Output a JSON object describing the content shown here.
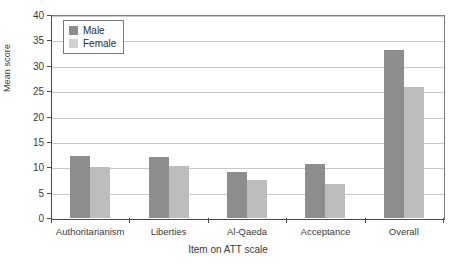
{
  "chart_data": {
    "type": "bar",
    "title": "",
    "xlabel": "Item on ATT scale",
    "ylabel": "Mean score",
    "ylim": [
      0,
      40
    ],
    "ytick_labels": [
      "0",
      "5",
      "10",
      "15",
      "20",
      "25",
      "30",
      "35",
      "40"
    ],
    "yticks": [
      0,
      5,
      10,
      15,
      20,
      25,
      30,
      35,
      40
    ],
    "grid": true,
    "legend_position": "top-left",
    "categories": [
      "Authoritarianism",
      "Liberties",
      "Al-Qaeda",
      "Acceptance",
      "Overall"
    ],
    "series": [
      {
        "name": "Male",
        "color": "#8d8d8d",
        "values": [
          12.3,
          12.0,
          9.1,
          10.6,
          33.2
        ]
      },
      {
        "name": "Female",
        "color": "#bdbdbd",
        "values": [
          10.1,
          10.2,
          7.5,
          6.8,
          25.9
        ]
      }
    ]
  },
  "legend": {
    "items": [
      {
        "label": "Male",
        "swatch": "male"
      },
      {
        "label": "Female",
        "swatch": "female"
      }
    ]
  }
}
